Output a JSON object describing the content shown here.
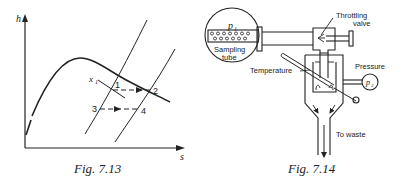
{
  "figures": [
    {
      "id": "left",
      "caption": "Fig. 7.13",
      "axes": {
        "y_label": "h",
        "x_label": "s"
      },
      "labels": {
        "x1": "x",
        "x1_sub": "1",
        "p1": "1",
        "p2": "2",
        "p3": "3",
        "p4": "4"
      }
    },
    {
      "id": "right",
      "caption": "Fig. 7.14",
      "labels": {
        "p1": "p",
        "p1_sub": "1",
        "sampling_tube_line1": "Sampling",
        "sampling_tube_line2": "tube",
        "throttling_valve_line1": "Throttling",
        "throttling_valve_line2": "valve",
        "temperature": "Temperature",
        "pressure": "Pressure",
        "p2": "p",
        "p2_sub": "2",
        "to_waste": "To waste"
      }
    }
  ],
  "colors": {
    "ink": "#222222",
    "background": "#ffffff"
  }
}
